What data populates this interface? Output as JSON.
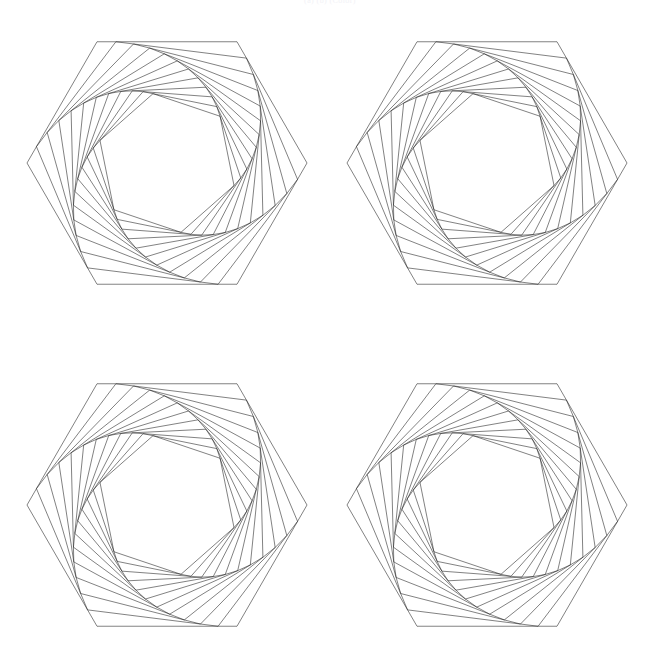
{
  "page": {
    "width": 660,
    "height": 653,
    "background": "#ffffff",
    "caption": "(a)                    (b)  (Color)"
  },
  "figure": {
    "title": "",
    "type": "geometric-line-drawing",
    "stroke_color": "#1a1a1a",
    "stroke_width": 0.55,
    "fill": "none",
    "panel_count": 4,
    "panels": [
      {
        "name": "panel-top-left",
        "cx": 167,
        "cy": 163,
        "radius": 140
      },
      {
        "name": "panel-top-right",
        "cx": 487,
        "cy": 163,
        "radius": 140
      },
      {
        "name": "panel-bottom-left",
        "cx": 167,
        "cy": 505,
        "radius": 140
      },
      {
        "name": "panel-bottom-right",
        "cx": 487,
        "cy": 505,
        "radius": 140
      }
    ],
    "spiral": {
      "sides": 6,
      "iterations": 12,
      "start_angle_deg": 0,
      "step_fraction": 0.135,
      "direction": "clockwise",
      "note": "Each successive hexagon's vertices sit a fixed fraction along each edge of the previous hexagon, producing a rotating inward spiral."
    }
  },
  "chart_data": {
    "type": "line",
    "xlabel": "",
    "ylabel": "",
    "grid": false,
    "legend": "none",
    "xlim": [
      0,
      660
    ],
    "ylim": [
      0,
      653
    ],
    "series": [
      {
        "name": "panel-top-left",
        "sides": 6,
        "iterations": 12,
        "center": [
          167,
          163
        ],
        "radius": 140,
        "step_fraction": 0.135
      },
      {
        "name": "panel-top-right",
        "sides": 6,
        "iterations": 12,
        "center": [
          487,
          163
        ],
        "radius": 140,
        "step_fraction": 0.135
      },
      {
        "name": "panel-bottom-left",
        "sides": 6,
        "iterations": 12,
        "center": [
          167,
          505
        ],
        "radius": 140,
        "step_fraction": 0.135
      },
      {
        "name": "panel-bottom-right",
        "sides": 6,
        "iterations": 12,
        "center": [
          487,
          505
        ],
        "radius": 140,
        "step_fraction": 0.135
      }
    ]
  }
}
